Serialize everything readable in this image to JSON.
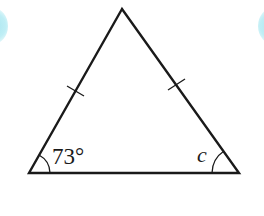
{
  "figure": {
    "type": "isosceles-triangle",
    "vertices": {
      "apex": [
        122,
        9
      ],
      "bottom_left": [
        29,
        173
      ],
      "bottom_right": [
        239,
        173
      ]
    },
    "equal_side_marks": [
      "left-side",
      "right-side"
    ],
    "angles": {
      "bottom_left": {
        "label": "73°",
        "value_degrees": 73
      },
      "bottom_right": {
        "label": "c",
        "value_degrees": null
      }
    },
    "colors": {
      "stroke": "#1a1a1a",
      "background": "#ffffff",
      "decoration": "#a8e6f0"
    }
  }
}
